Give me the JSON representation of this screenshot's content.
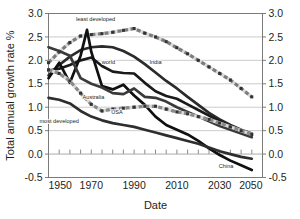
{
  "chart_data": {
    "type": "line",
    "title": "",
    "xlabel": "Date",
    "ylabel": "Total annual growth rate %",
    "xlim": [
      1950,
      2050
    ],
    "ylim": [
      -0.5,
      3.0
    ],
    "xticks": [
      1950,
      1970,
      1990,
      2010,
      2030,
      2050
    ],
    "xtick_labels": [
      "1950",
      "1970",
      "1990",
      "2010",
      "2030",
      "2050"
    ],
    "yticks": [
      -0.5,
      0.0,
      0.5,
      1.0,
      1.5,
      2.0,
      2.5,
      3.0
    ],
    "ytick_labels": [
      "-0.5",
      "0.0",
      "0.5",
      "1.0",
      "1.5",
      "2.0",
      "2.5",
      "3.0"
    ],
    "grid": "horizontal",
    "minor_tick_interval": 5,
    "dual_y_axis": true,
    "legend": "inline-annotations",
    "series": [
      {
        "name": "least developed",
        "label": "least developed",
        "color": "#7d7d7d",
        "style": "marker-line",
        "label_xy": [
          1972,
          2.83
        ],
        "x": [
          1950,
          1955,
          1960,
          1965,
          1970,
          1975,
          1980,
          1985,
          1990,
          1995,
          2000,
          2005,
          2010,
          2015,
          2020,
          2025,
          2030,
          2035,
          2040,
          2045
        ],
        "values": [
          1.95,
          2.18,
          2.38,
          2.52,
          2.55,
          2.57,
          2.6,
          2.64,
          2.68,
          2.58,
          2.5,
          2.4,
          2.27,
          2.14,
          2.0,
          1.86,
          1.72,
          1.58,
          1.4,
          1.22
        ]
      },
      {
        "name": "India",
        "label": "India",
        "color": "#2b2b2b",
        "style": "solid",
        "label_xy": [
          2000,
          1.93
        ],
        "x": [
          1950,
          1955,
          1960,
          1965,
          1970,
          1975,
          1980,
          1985,
          1990,
          1995,
          2000,
          2005,
          2010,
          2015,
          2020,
          2025,
          2030,
          2035,
          2040,
          2045
        ],
        "values": [
          1.68,
          1.9,
          2.08,
          2.22,
          2.28,
          2.3,
          2.28,
          2.2,
          2.08,
          1.92,
          1.74,
          1.56,
          1.4,
          1.22,
          1.05,
          0.88,
          0.74,
          0.62,
          0.52,
          0.44
        ]
      },
      {
        "name": "world",
        "label": "world",
        "color": "#1a1a1a",
        "style": "solid",
        "label_xy": [
          1978,
          1.93
        ],
        "x": [
          1950,
          1955,
          1960,
          1965,
          1970,
          1975,
          1980,
          1985,
          1990,
          1995,
          2000,
          2005,
          2010,
          2015,
          2020,
          2025,
          2030,
          2035,
          2040,
          2045
        ],
        "values": [
          1.78,
          1.82,
          1.9,
          2.0,
          2.06,
          1.88,
          1.76,
          1.73,
          1.72,
          1.52,
          1.34,
          1.24,
          1.18,
          1.06,
          0.94,
          0.82,
          0.7,
          0.58,
          0.48,
          0.4
        ]
      },
      {
        "name": "China",
        "label": "China",
        "color": "#101010",
        "style": "solid",
        "label_xy": [
          2033,
          -0.3
        ],
        "x": [
          1950,
          1955,
          1960,
          1965,
          1968,
          1970,
          1975,
          1980,
          1985,
          1990,
          1995,
          2000,
          2005,
          2010,
          2015,
          2020,
          2025,
          2030,
          2035,
          2040,
          2045
        ],
        "values": [
          1.62,
          1.95,
          1.52,
          2.1,
          2.65,
          2.18,
          1.45,
          1.38,
          1.48,
          1.25,
          1.05,
          0.8,
          0.62,
          0.52,
          0.42,
          0.28,
          0.12,
          -0.02,
          -0.14,
          -0.24,
          -0.34
        ]
      },
      {
        "name": "Australia",
        "label": "Australia",
        "color": "#3a3a3a",
        "style": "solid",
        "label_xy": [
          1971,
          1.18
        ],
        "x": [
          1950,
          1955,
          1960,
          1965,
          1970,
          1975,
          1980,
          1985,
          1990,
          1995,
          2000,
          2005,
          2010,
          2015,
          2020,
          2025,
          2030,
          2035,
          2040,
          2045
        ],
        "values": [
          2.28,
          2.2,
          2.1,
          1.62,
          1.5,
          1.42,
          1.3,
          1.28,
          1.4,
          1.22,
          1.2,
          1.12,
          1.0,
          0.9,
          0.8,
          0.7,
          0.6,
          0.52,
          0.44,
          0.36
        ]
      },
      {
        "name": "USA",
        "label": "USA",
        "color": "#8a8a8a",
        "style": "marker-line",
        "label_xy": [
          1982,
          0.86
        ],
        "x": [
          1950,
          1955,
          1960,
          1965,
          1970,
          1975,
          1980,
          1985,
          1990,
          1995,
          2000,
          2005,
          2010,
          2015,
          2020,
          2025,
          2030,
          2035,
          2040,
          2045
        ],
        "values": [
          1.8,
          1.72,
          1.56,
          1.3,
          1.06,
          0.92,
          0.96,
          0.98,
          1.0,
          1.02,
          1.02,
          0.96,
          0.9,
          0.86,
          0.8,
          0.74,
          0.66,
          0.58,
          0.5,
          0.42
        ]
      },
      {
        "name": "most developed",
        "label": "most developed",
        "color": "#2e2e2e",
        "style": "solid",
        "label_xy": [
          1955,
          0.66
        ],
        "x": [
          1950,
          1955,
          1960,
          1965,
          1970,
          1975,
          1980,
          1985,
          1990,
          1995,
          2000,
          2005,
          2010,
          2015,
          2020,
          2025,
          2030,
          2035,
          2040,
          2045
        ],
        "values": [
          1.2,
          1.16,
          1.08,
          0.92,
          0.8,
          0.72,
          0.66,
          0.62,
          0.58,
          0.52,
          0.46,
          0.4,
          0.34,
          0.28,
          0.22,
          0.14,
          0.06,
          0.0,
          -0.06,
          -0.1
        ]
      }
    ]
  },
  "colors": {
    "axis": "#6d6d6d",
    "grid": "#b4b4b4",
    "text": "#231f20",
    "background": "#ffffff"
  }
}
